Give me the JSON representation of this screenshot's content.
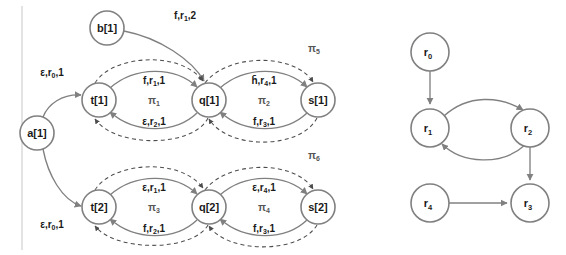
{
  "figure": {
    "colors": {
      "node_stroke": "#808080",
      "node_fill": "#ffffff",
      "solid_edge": "#808080",
      "dashed_edge": "#4d4d4d",
      "text": "#1a1a1a",
      "pi_text": "#555555",
      "frame": "#cccccc"
    }
  },
  "left_graph": {
    "name": "automaton-graph",
    "nodes": [
      {
        "id": "a1",
        "label": "a[1]",
        "cx": 37,
        "cy": 133,
        "r": 17
      },
      {
        "id": "b1",
        "label": "b[1]",
        "cx": 107,
        "cy": 28,
        "r": 17
      },
      {
        "id": "t1",
        "label": "t[1]",
        "cx": 99,
        "cy": 100,
        "r": 17
      },
      {
        "id": "q1",
        "label": "q[1]",
        "cx": 209,
        "cy": 100,
        "r": 17
      },
      {
        "id": "s1",
        "label": "s[1]",
        "cx": 318,
        "cy": 100,
        "r": 17
      },
      {
        "id": "t2",
        "label": "t[2]",
        "cx": 99,
        "cy": 207,
        "r": 17
      },
      {
        "id": "q2",
        "label": "q[2]",
        "cx": 209,
        "cy": 207,
        "r": 17
      },
      {
        "id": "s2",
        "label": "s[2]",
        "cx": 318,
        "cy": 207,
        "r": 17
      }
    ],
    "edge_labels": {
      "a1_to_t1": "ε,r",
      "a1_to_t1_sub": "0",
      "a1_to_t1_tail": ",1",
      "a1_to_t2": "ε,r",
      "a1_to_t2_sub": "0",
      "a1_to_t2_tail": ",1",
      "b1_to_q1": "f,r",
      "b1_to_q1_sub": "1",
      "b1_to_q1_tail": ",2",
      "t1_to_q1_top": "f,r",
      "t1_to_q1_top_sub": "1",
      "t1_to_q1_top_tail": ",1",
      "t1_to_q1_bottom": "ε,r",
      "t1_to_q1_bottom_sub": "2",
      "t1_to_q1_bottom_tail": ",1",
      "q1_to_s1_top": "h̄,r",
      "q1_to_s1_top_sub": "4",
      "q1_to_s1_top_tail": ",1",
      "q1_to_s1_bottom": "f,r",
      "q1_to_s1_bottom_sub": "3",
      "q1_to_s1_bottom_tail": ",1",
      "t2_to_q2_top": "ε,r",
      "t2_to_q2_top_sub": "1",
      "t2_to_q2_top_tail": ",1",
      "t2_to_q2_bottom": "f,r",
      "t2_to_q2_bottom_sub": "2",
      "t2_to_q2_bottom_tail": ",1",
      "q2_to_s2_top": "ε,r",
      "q2_to_s2_top_sub": "4",
      "q2_to_s2_top_tail": ",1",
      "q2_to_s2_bottom": "f,r",
      "q2_to_s2_bottom_sub": "3",
      "q2_to_s2_bottom_tail": ",1"
    },
    "pi_labels": [
      {
        "id": "pi1",
        "base": "π",
        "sub": "1",
        "x": 154,
        "y": 100
      },
      {
        "id": "pi2",
        "base": "π",
        "sub": "2",
        "x": 264,
        "y": 100
      },
      {
        "id": "pi3",
        "base": "π",
        "sub": "3",
        "x": 154,
        "y": 207
      },
      {
        "id": "pi4",
        "base": "π",
        "sub": "4",
        "x": 264,
        "y": 207
      },
      {
        "id": "pi5",
        "base": "π",
        "sub": "5",
        "x": 314,
        "y": 48
      },
      {
        "id": "pi6",
        "base": "π",
        "sub": "6",
        "x": 314,
        "y": 155
      }
    ]
  },
  "right_graph": {
    "name": "resource-graph",
    "nodes": [
      {
        "id": "r0",
        "label": "r",
        "sub": "0",
        "cx": 430,
        "cy": 52,
        "r": 19
      },
      {
        "id": "r1",
        "label": "r",
        "sub": "1",
        "cx": 430,
        "cy": 128,
        "r": 19
      },
      {
        "id": "r2",
        "label": "r",
        "sub": "2",
        "cx": 530,
        "cy": 128,
        "r": 19
      },
      {
        "id": "r4",
        "label": "r",
        "sub": "4",
        "cx": 430,
        "cy": 203,
        "r": 19
      },
      {
        "id": "r3",
        "label": "r",
        "sub": "3",
        "cx": 530,
        "cy": 203,
        "r": 19
      }
    ],
    "edges": [
      {
        "id": "r0-r1",
        "from": "r0",
        "to": "r1"
      },
      {
        "id": "r1-r2",
        "from": "r1",
        "to": "r2"
      },
      {
        "id": "r2-r1",
        "from": "r2",
        "to": "r1"
      },
      {
        "id": "r2-r3",
        "from": "r2",
        "to": "r3"
      },
      {
        "id": "r4-r3",
        "from": "r4",
        "to": "r3"
      }
    ]
  }
}
